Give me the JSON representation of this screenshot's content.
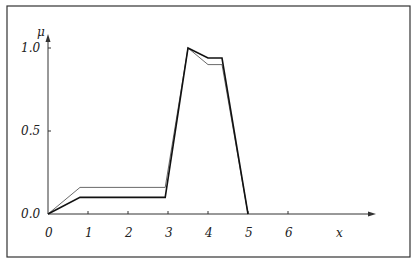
{
  "chart_data": {
    "type": "line",
    "title": "",
    "xlabel": "x",
    "ylabel": "μ",
    "xlim": [
      0,
      8.2
    ],
    "ylim": [
      0,
      1.08
    ],
    "x_ticks": [
      "0",
      "1",
      "2",
      "3",
      "4",
      "5",
      "6"
    ],
    "y_ticks": [
      "0.0",
      "0.5",
      "1.0"
    ],
    "grid": false,
    "legend": null,
    "series": [
      {
        "name": "thin",
        "style": "thin",
        "points": [
          [
            0,
            0
          ],
          [
            0.8,
            0.16
          ],
          [
            2.93,
            0.16
          ],
          [
            3.5,
            1.0
          ],
          [
            4.0,
            0.9
          ],
          [
            4.35,
            0.9
          ],
          [
            5.0,
            0
          ]
        ]
      },
      {
        "name": "thick",
        "style": "thick",
        "points": [
          [
            0,
            0
          ],
          [
            0.8,
            0.1
          ],
          [
            2.93,
            0.1
          ],
          [
            3.5,
            1.0
          ],
          [
            4.0,
            0.94
          ],
          [
            4.35,
            0.94
          ],
          [
            5.0,
            0
          ]
        ]
      }
    ]
  },
  "axis": {
    "x_label": "x",
    "y_label": "μ",
    "x_ticks": [
      {
        "v": 0,
        "label": "0"
      },
      {
        "v": 1,
        "label": "1"
      },
      {
        "v": 2,
        "label": "2"
      },
      {
        "v": 3,
        "label": "3"
      },
      {
        "v": 4,
        "label": "4"
      },
      {
        "v": 5,
        "label": "5"
      },
      {
        "v": 6,
        "label": "6"
      }
    ],
    "y_ticks": [
      {
        "v": 0,
        "label": "0.0"
      },
      {
        "v": 0.5,
        "label": "0.5"
      },
      {
        "v": 1.0,
        "label": "1.0"
      }
    ]
  },
  "colors": {
    "axis": "#333333",
    "thin": "#444444",
    "thick": "#111111",
    "frame": "#333333"
  }
}
